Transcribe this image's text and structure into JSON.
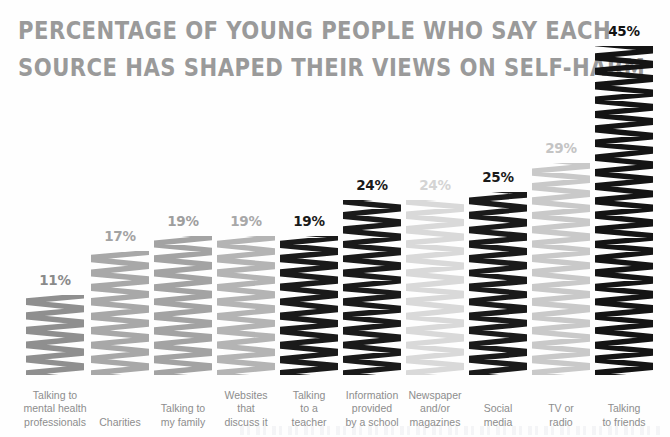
{
  "title": {
    "line1": "Percentage of young people who say each",
    "line2": "source has shaped their views on self-harm",
    "color": "#9a9a9a"
  },
  "chart_data": {
    "type": "bar",
    "title": "Percentage of young people who say each source has shaped their views on self-harm",
    "xlabel": "",
    "ylabel": "",
    "ylim": [
      0,
      45
    ],
    "grid": false,
    "legend": "none",
    "value_suffix": "%",
    "categories": [
      "Talking to\nmental health\nprofessionals",
      "Charities",
      "Talking to\nmy family",
      "Websites\nthat\ndiscuss it",
      "Talking\nto a\nteacher",
      "Information\nprovided\nby a school",
      "Newspaper\nand/or\nmagazines",
      "Social\nmedia",
      "TV or\nradio",
      "Talking\nto friends"
    ],
    "values": [
      11,
      17,
      19,
      19,
      19,
      24,
      24,
      25,
      29,
      45
    ],
    "value_labels": [
      "11%",
      "17%",
      "19%",
      "19%",
      "19%",
      "24%",
      "24%",
      "25%",
      "29%",
      "45%"
    ],
    "bar_colors": [
      "#8f8f8f",
      "#a8a8a8",
      "#a3a3a3",
      "#b4b4b4",
      "#1a1a1a",
      "#1a1a1a",
      "#d9d9d9",
      "#1a1a1a",
      "#c9c9c9",
      "#141414"
    ],
    "label_colors": [
      "#8a8a8a",
      "#a3a3a3",
      "#9e9e9e",
      "#a8a8a8",
      "#1a1a1a",
      "#1a1a1a",
      "#d4d4d4",
      "#1a1a1a",
      "#c4c4c4",
      "#121212"
    ],
    "category_label_color": "#8d8d8d",
    "style": "hand-drawn scribble marker fill"
  },
  "layout": {
    "bar_left_positions": [
      26,
      91,
      154,
      217,
      280,
      343,
      406,
      469,
      532,
      595
    ],
    "bar_width": 58,
    "baseline_y": 375,
    "px_per_percent": 7.3
  }
}
